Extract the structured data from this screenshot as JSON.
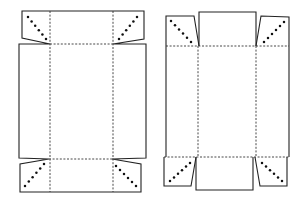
{
  "figure": {
    "title": "Box nets with corner gusset fold flaps",
    "colors": {
      "line": "#222222",
      "fold": "#333333",
      "dot": "#111111",
      "background": "#ffffff"
    },
    "legend": {
      "solid": "cut edge",
      "dashed": "fold line",
      "dotted": "diagonal gusset fold"
    }
  },
  "diagram": {
    "nets": [
      {
        "id": "net-left",
        "label": "Net A (wide end flaps with tapered corner tabs)",
        "cut_paths": [
          "M22,38 L22,11 L144,11 L144,39 L113,44 L146,44 L146,158 L112,159 L141,164 L141,192 L20,192 L20,164 L49,159 L19,158 L19,44 L50,44 Z"
        ],
        "fold_lines": [
          [
            50,
            44,
            113,
            44
          ],
          [
            49,
            159,
            112,
            159
          ],
          [
            50,
            11,
            50,
            192
          ],
          [
            113,
            11,
            113,
            192
          ]
        ],
        "dot_rows": [
          {
            "from": [
              28,
              17
            ],
            "to": [
              46,
              39
            ],
            "count": 6
          },
          {
            "from": [
              137,
              17
            ],
            "to": [
              119,
              39
            ],
            "count": 6
          },
          {
            "from": [
              25,
              186
            ],
            "to": [
              44,
              164
            ],
            "count": 6
          },
          {
            "from": [
              116,
              166
            ],
            "to": [
              136,
              186
            ],
            "count": 6
          }
        ]
      },
      {
        "id": "net-right",
        "label": "Net B (tall body with separate end panels and angled corner tabs)",
        "cut_paths": [
          "M166,46 L166,16 L194,16 L199,46",
          "M199,46 L199,12 L256,12 L256,46",
          "M256,46 L261,16 L289,17 L289,46",
          "M166,46 L166,157",
          "M289,46 L289,157",
          "M164,157 L164,186 L191,186 L196,157",
          "M196,157 L196,190 L253,190 L253,157",
          "M255,157 L260,186 L287,186 L287,157"
        ],
        "fold_lines": [
          [
            166,
            46,
            289,
            46
          ],
          [
            164,
            157,
            289,
            157
          ],
          [
            198,
            46,
            198,
            157
          ],
          [
            256,
            46,
            256,
            157
          ]
        ],
        "dot_rows": [
          {
            "from": [
              171,
              21
            ],
            "to": [
              191,
              42
            ],
            "count": 6
          },
          {
            "from": [
              284,
              22
            ],
            "to": [
              264,
              42
            ],
            "count": 6
          },
          {
            "from": [
              170,
              181
            ],
            "to": [
              190,
              163
            ],
            "count": 6
          },
          {
            "from": [
              262,
              163
            ],
            "to": [
              282,
              181
            ],
            "count": 6
          }
        ]
      }
    ]
  }
}
